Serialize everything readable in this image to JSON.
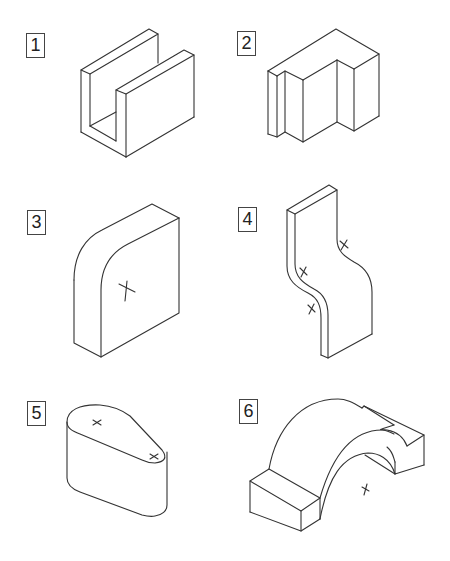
{
  "worksheet": {
    "figures": [
      {
        "number": "1",
        "shape": "U-channel block"
      },
      {
        "number": "2",
        "shape": "Stepped block with slot"
      },
      {
        "number": "3",
        "shape": "Block with rounded corner and center mark"
      },
      {
        "number": "4",
        "shape": "S-curved plate with center marks"
      },
      {
        "number": "5",
        "shape": "Tapered rounded-end block with center marks"
      },
      {
        "number": "6",
        "shape": "Arched bridge block with center mark"
      }
    ]
  }
}
